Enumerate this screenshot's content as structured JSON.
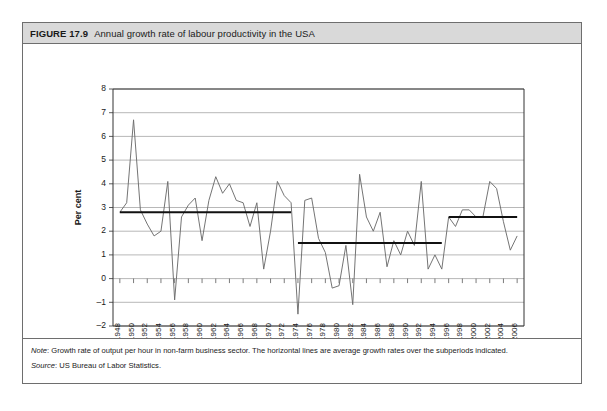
{
  "figure": {
    "number": "FIGURE 17.9",
    "title": "Annual growth rate of labour productivity in the USA"
  },
  "notes": {
    "note_label": "Note",
    "note_text": ": Growth rate of output per hour in non-farm business sector. The horizontal lines are average growth rates over the subperiods indicated.",
    "source_label": "Source",
    "source_text": ": US Bureau of Labor Statistics."
  },
  "chart_data": {
    "type": "line",
    "title": "Annual growth rate of labour productivity in the USA",
    "xlabel": "Year",
    "ylabel": "Per cent",
    "xlim": [
      1947,
      2007
    ],
    "ylim": [
      -2,
      8
    ],
    "yticks": [
      -2,
      -1,
      0,
      1,
      2,
      3,
      4,
      5,
      6,
      7,
      8
    ],
    "xticks": [
      1948,
      1950,
      1952,
      1954,
      1956,
      1958,
      1960,
      1962,
      1964,
      1966,
      1968,
      1970,
      1972,
      1974,
      1976,
      1978,
      1980,
      1982,
      1984,
      1986,
      1988,
      1990,
      1992,
      1994,
      1996,
      1998,
      2000,
      2002,
      2004,
      2006
    ],
    "grid": true,
    "legend": false,
    "series": [
      {
        "name": "Annual growth rate of labour productivity",
        "color": "#6d6d6d",
        "x": [
          1948,
          1949,
          1950,
          1951,
          1952,
          1953,
          1954,
          1955,
          1956,
          1957,
          1958,
          1959,
          1960,
          1961,
          1962,
          1963,
          1964,
          1965,
          1966,
          1967,
          1968,
          1969,
          1970,
          1971,
          1972,
          1973,
          1974,
          1975,
          1976,
          1977,
          1978,
          1979,
          1980,
          1981,
          1982,
          1983,
          1984,
          1985,
          1986,
          1987,
          1988,
          1989,
          1990,
          1991,
          1992,
          1993,
          1994,
          1995,
          1996,
          1997,
          1998,
          1999,
          2000,
          2001,
          2002,
          2003,
          2004,
          2005,
          2006
        ],
        "values": [
          2.8,
          3.2,
          6.7,
          2.9,
          2.3,
          1.8,
          2.0,
          4.1,
          -0.9,
          2.6,
          3.1,
          3.4,
          1.6,
          3.3,
          4.3,
          3.6,
          4.0,
          3.3,
          3.2,
          2.2,
          3.2,
          0.4,
          2.0,
          4.1,
          3.5,
          3.2,
          -1.5,
          3.3,
          3.4,
          1.7,
          1.1,
          -0.4,
          -0.3,
          1.4,
          -1.1,
          4.4,
          2.6,
          2.0,
          2.8,
          0.5,
          1.6,
          1.0,
          2.0,
          1.4,
          4.1,
          0.4,
          1.0,
          0.4,
          2.6,
          2.2,
          2.9,
          2.9,
          2.6,
          2.6,
          4.1,
          3.8,
          2.4,
          1.2,
          1.8
        ]
      }
    ],
    "average_lines": [
      {
        "label": "1948-1973 average",
        "start_year": 1948,
        "end_year": 1973,
        "value": 2.8
      },
      {
        "label": "1974-1995 average",
        "start_year": 1974,
        "end_year": 1995,
        "value": 1.5
      },
      {
        "label": "1996-2006 average",
        "start_year": 1996,
        "end_year": 2006,
        "value": 2.6
      }
    ]
  }
}
